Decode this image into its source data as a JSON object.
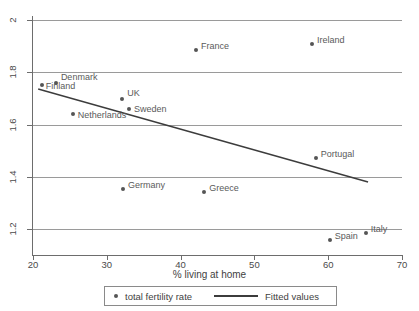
{
  "chart_data": {
    "type": "scatter",
    "title": "",
    "xlabel": "% living at home",
    "ylabel": "",
    "xlim": [
      20,
      70
    ],
    "ylim": [
      1.1,
      2.0
    ],
    "grid": true,
    "legend_position": "bottom",
    "xticks": [
      "20",
      "30",
      "40",
      "50",
      "60",
      "70"
    ],
    "xtick_values": [
      20,
      30,
      40,
      50,
      60,
      70
    ],
    "yticks": [
      "2",
      "1.8",
      "1.6",
      "1.4",
      "1.2"
    ],
    "ytick_values": [
      2,
      1.8,
      1.6,
      1.4,
      1.2
    ],
    "series": [
      {
        "name": "total fertility rate",
        "type": "scatter",
        "marker_color": "#555555",
        "points": [
          {
            "label": "Finland",
            "x": 21.2,
            "y": 1.75,
            "label_dx": 4,
            "label_dy": 1
          },
          {
            "label": "Denmark",
            "x": 23.1,
            "y": 1.758,
            "label_dx": 5,
            "label_dy": -6
          },
          {
            "label": "Netherlands",
            "x": 25.4,
            "y": 1.64,
            "label_dx": 5,
            "label_dy": 1
          },
          {
            "label": "UK",
            "x": 32.1,
            "y": 1.697,
            "label_dx": 5,
            "label_dy": -6
          },
          {
            "label": "Sweden",
            "x": 33.0,
            "y": 1.66,
            "label_dx": 5,
            "label_dy": 0
          },
          {
            "label": "France",
            "x": 42.1,
            "y": 1.885,
            "label_dx": 5,
            "label_dy": -4
          },
          {
            "label": "Ireland",
            "x": 57.8,
            "y": 1.91,
            "label_dx": 5,
            "label_dy": -4
          },
          {
            "label": "Germany",
            "x": 32.2,
            "y": 1.355,
            "label_dx": 5,
            "label_dy": -4
          },
          {
            "label": "Greece",
            "x": 43.2,
            "y": 1.34,
            "label_dx": 5,
            "label_dy": -4
          },
          {
            "label": "Portugal",
            "x": 58.3,
            "y": 1.47,
            "label_dx": 5,
            "label_dy": -4
          },
          {
            "label": "Spain",
            "x": 60.2,
            "y": 1.157,
            "label_dx": 5,
            "label_dy": -4
          },
          {
            "label": "Italy",
            "x": 65.1,
            "y": 1.185,
            "label_dx": 5,
            "label_dy": -4
          }
        ]
      },
      {
        "name": "Fitted values",
        "type": "line",
        "line_color": "#3c3c3c",
        "endpoints": [
          {
            "x": 20.7,
            "y": 1.736
          },
          {
            "x": 65.4,
            "y": 1.38
          }
        ]
      }
    ]
  },
  "legend": {
    "points_label": "total fertility rate",
    "line_label": "Fitted values"
  },
  "axis": {
    "x_title": "% living at home"
  }
}
